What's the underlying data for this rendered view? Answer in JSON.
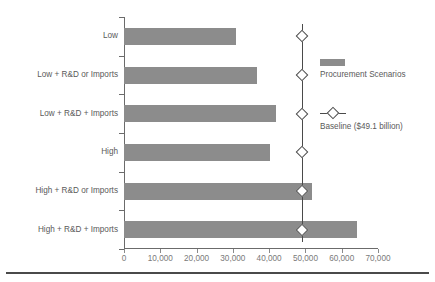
{
  "chart_data": {
    "type": "bar",
    "orientation": "horizontal",
    "title": "",
    "subtitle": "",
    "xlabel": "",
    "ylabel": "",
    "xlim": [
      0,
      70000
    ],
    "xticks": [
      0,
      10000,
      20000,
      30000,
      40000,
      50000,
      60000,
      70000
    ],
    "xtick_labels": [
      "0",
      "10,000",
      "20,000",
      "30,000",
      "40,000",
      "50,000",
      "60,000",
      "70,000"
    ],
    "grid": false,
    "legend_position": "right",
    "categories": [
      "Low",
      "Low + R&D or Imports",
      "Low + R&D + Imports",
      "High",
      "High + R&D or Imports",
      "High + R&D + Imports"
    ],
    "series": [
      {
        "name": "Procurement Scenarios",
        "color": "#8c8c8c",
        "values": [
          30800,
          36600,
          41900,
          40200,
          51800,
          64200
        ]
      }
    ],
    "reference_line": {
      "name": "Baseline ($49.1 billion)",
      "value": 49100,
      "color": "#4a4a4a",
      "marker": "diamond"
    }
  },
  "legend": {
    "items": [
      {
        "label": "Procurement Scenarios",
        "icon": "bar-swatch-icon"
      },
      {
        "label": "Baseline ($49.1 billion)",
        "icon": "diamond-marker-icon"
      }
    ]
  }
}
